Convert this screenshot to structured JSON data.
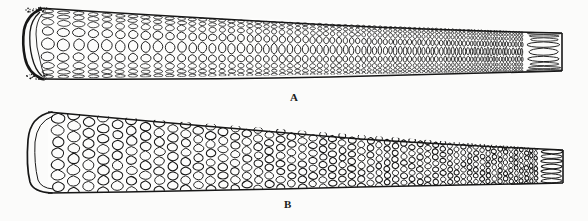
{
  "figure": {
    "background_color": "#fbfbfa",
    "ink_color": "#171717",
    "panels": [
      {
        "label": "A",
        "label_x": 290,
        "label_y": 92,
        "description": "tapering tubular structure with elongated lens-shaped cells, concave open left end",
        "cell_pattern": "elongated-oval",
        "left_end": "concave-open",
        "right_end": "straight-cut",
        "outline": {
          "x_start": 22,
          "x_end": 562,
          "top_left_y": 8,
          "top_right_y": 33,
          "bottom_left_y": 79,
          "bottom_right_y": 71
        },
        "row_count": 9,
        "column_count": 74
      },
      {
        "label": "B",
        "label_x": 284,
        "label_y": 199,
        "description": "tapering tubular structure with rounded polygonal honeycomb cells, smooth concave left end",
        "cell_pattern": "rounded-polygon",
        "left_end": "concave-smooth",
        "right_end": "straight-cut",
        "outline": {
          "x_start": 30,
          "x_end": 563,
          "top_left_y": 112,
          "top_right_y": 150,
          "bottom_left_y": 193,
          "bottom_right_y": 183
        },
        "row_count": 7,
        "column_count": 52
      }
    ]
  },
  "chart_data": {
    "type": "table",
    "title": "",
    "panels": [
      {
        "id": "A",
        "label": "A",
        "cells_wide": 74,
        "cells_tall": 9,
        "taper_ratio": 0.53
      },
      {
        "id": "B",
        "label": "B",
        "cells_wide": 52,
        "cells_tall": 7,
        "taper_ratio": 0.41
      }
    ]
  }
}
